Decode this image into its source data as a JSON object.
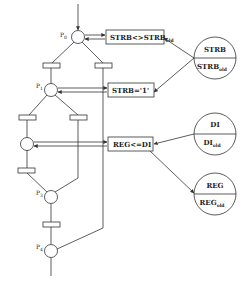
{
  "diagram": {
    "type": "petri-net",
    "places": [
      {
        "id": "p0",
        "label": "P",
        "sub": "0"
      },
      {
        "id": "p1",
        "label": "P",
        "sub": "1"
      },
      {
        "id": "p2",
        "label": "",
        "sub": ""
      },
      {
        "id": "p3",
        "label": "P",
        "sub": "3"
      },
      {
        "id": "p4",
        "label": "P",
        "sub": "4"
      }
    ],
    "actions": [
      {
        "id": "a0",
        "text": "STRB<>STRB",
        "sub": "old"
      },
      {
        "id": "a1",
        "text": "STRB='1'",
        "sub": ""
      },
      {
        "id": "a2",
        "text": "REG<=DI",
        "sub": ""
      }
    ],
    "signals": [
      {
        "id": "strb",
        "top": "STRB",
        "bottom": "STRB",
        "bottom_sub": "old"
      },
      {
        "id": "di",
        "top": "DI",
        "bottom": "DI",
        "bottom_sub": "old"
      },
      {
        "id": "reg",
        "top": "REG",
        "bottom": "REG",
        "bottom_sub": "old"
      }
    ],
    "transition_count": 6
  }
}
